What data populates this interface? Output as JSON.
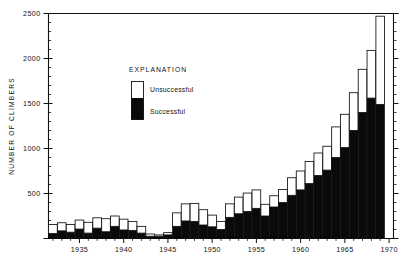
{
  "chart_data": {
    "type": "bar",
    "title": "",
    "subtitle": "",
    "xlabel": "",
    "ylabel": "NUMBER OF CLIMBERS",
    "xlim": [
      1931.5,
      1970.5
    ],
    "ylim": [
      0,
      2500
    ],
    "grid": false,
    "stacked": true,
    "legend_position": "inside-upper-left",
    "y_ticks": [
      0,
      500,
      1000,
      1500,
      2000,
      2500
    ],
    "y_tick_labels": [
      "",
      "500",
      "1000",
      "1500",
      "2000",
      "2500"
    ],
    "y_minor_tick_interval": 100,
    "x_ticks": [
      1935,
      1940,
      1945,
      1950,
      1955,
      1960,
      1965,
      1970
    ],
    "x_tick_labels": [
      "1935",
      "1940",
      "1945",
      "1950",
      "1955",
      "1960",
      "1965",
      "1970"
    ],
    "categories": [
      1932,
      1933,
      1934,
      1935,
      1936,
      1937,
      1938,
      1939,
      1940,
      1941,
      1942,
      1943,
      1944,
      1945,
      1946,
      1947,
      1948,
      1949,
      1950,
      1951,
      1952,
      1953,
      1954,
      1955,
      1956,
      1957,
      1958,
      1959,
      1960,
      1961,
      1962,
      1963,
      1964,
      1965,
      1966,
      1967,
      1968,
      1969
    ],
    "series": [
      {
        "name": "Successful",
        "color": "#0a0a0a",
        "values": [
          55,
          85,
          70,
          105,
          60,
          115,
          75,
          135,
          95,
          90,
          60,
          25,
          25,
          40,
          135,
          195,
          190,
          150,
          130,
          100,
          235,
          275,
          300,
          335,
          250,
          350,
          400,
          480,
          540,
          610,
          700,
          760,
          900,
          1010,
          1200,
          1400,
          1560,
          1490
        ]
      },
      {
        "name": "Unsuccessful",
        "color": "#ffffff",
        "values": [
          100,
          90,
          85,
          100,
          120,
          115,
          145,
          115,
          120,
          100,
          75,
          25,
          15,
          25,
          150,
          190,
          200,
          170,
          130,
          90,
          150,
          185,
          205,
          205,
          130,
          125,
          145,
          195,
          210,
          245,
          250,
          265,
          340,
          370,
          420,
          480,
          530,
          980
        ]
      }
    ],
    "totals": [
      155,
      175,
      155,
      205,
      180,
      230,
      220,
      250,
      215,
      190,
      135,
      50,
      40,
      65,
      285,
      385,
      390,
      320,
      260,
      190,
      385,
      460,
      505,
      540,
      380,
      475,
      545,
      675,
      750,
      855,
      950,
      1025,
      1240,
      1380,
      1620,
      1880,
      2090,
      2470
    ]
  },
  "legend": {
    "title": "EXPLANATION",
    "entries": [
      {
        "label": "Unsuccessful",
        "swatch": "white"
      },
      {
        "label": "Successful",
        "swatch": "black"
      }
    ]
  }
}
